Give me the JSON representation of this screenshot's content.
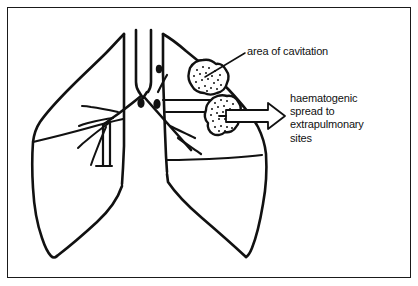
{
  "figure": {
    "type": "medical-line-diagram",
    "background_color": "#ffffff",
    "ink_color": "#111111",
    "frame": {
      "border_color": "#1a1a1a",
      "border_width_px": 1.3
    }
  },
  "labels": {
    "cavitation": {
      "text": "area of cavitation",
      "lines": [
        "area of cavitation"
      ]
    },
    "haematogenic": {
      "text": "haematogenic spread to extrapulmonary sites",
      "lines": [
        "haematogenic",
        "spread to",
        "extrapulmonary",
        "sites"
      ]
    }
  },
  "anatomy": {
    "trachea": "trachea",
    "carina": "carina",
    "left_lung": "left lung outline",
    "right_lung": "right lung outline",
    "bronchi_left": "left bronchial tree branches",
    "bronchi_right": "right bronchial tree branches",
    "lymph_nodes": [
      "hilar lymph node upper right",
      "hilar lymph node lower left",
      "hilar lymph node lower right"
    ],
    "lesions": [
      "upper cavitation lesion",
      "lower cavitation lesion"
    ],
    "fissures": [
      "left lung horizontal fissure",
      "right lung horizontal fissure"
    ]
  },
  "annotations": {
    "leader_line": "leader line to upper cavitation lesion",
    "spread_arrow": "hollow block arrow indicating haematogenous spread"
  }
}
